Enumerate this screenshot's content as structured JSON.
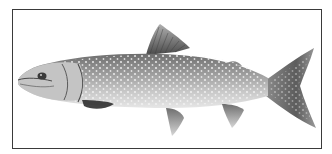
{
  "image": {
    "subject": "lake trout illustration",
    "frame": {
      "border_color": "#3a3a3a",
      "background": "#ffffff"
    },
    "colors": {
      "body_light": "#d2d2d2",
      "body_mid": "#9a9a9a",
      "body_dark": "#5a5a5a",
      "spots": "#f4f4f4",
      "fin_dark": "#444444"
    }
  }
}
